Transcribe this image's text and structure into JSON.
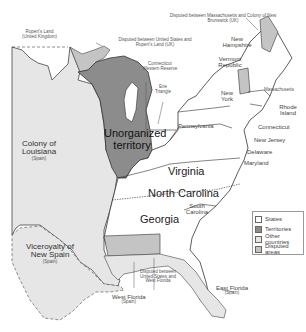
{
  "colors": {
    "states": "#ffffff",
    "territories": "#8c8c8c",
    "other_countries": "#e6e6e6",
    "disputed_areas": "#c4c4c4",
    "water": "#ffffff",
    "border": "#333333"
  },
  "labels": {
    "ruperts_land": {
      "name": "Rupert's Land",
      "sub": "(United Kingdom)"
    },
    "disputed_us_ruperts": "Disputed between United States and Rupert's Land (UK)",
    "disputed_mass_nb": "Disputed between Massachusetts and Colony of New Brunswick (UK)",
    "new_hampshire": "New Hampshire",
    "vermont": "Vermont Republic",
    "massachusetts": "Massachusetts",
    "connecticut_wr": "Connecticut Western Reserve",
    "erie_triangle": "Erie Triangle",
    "new_york": "New York",
    "rhode_island": "Rhode Island",
    "connecticut": "Connecticut",
    "pennsylvania": "Pennsylvania",
    "new_jersey": "New Jersey",
    "delaware": "Delaware",
    "maryland": "Maryland",
    "unorganized": "Unorganized territory",
    "louisiana": {
      "name": "Colony of Louisiana",
      "sub": "(Spain)"
    },
    "virginia": "Virginia",
    "north_carolina": "North Carolina",
    "south_carolina": "South Carolina",
    "georgia": "Georgia",
    "new_spain": {
      "name": "Viceroyalty of New Spain",
      "sub": "(Spain)"
    },
    "disputed_us_wf": "Disputed between United States and West Florida",
    "east_florida": {
      "name": "East Florida",
      "sub": "(Spain)"
    },
    "west_florida": {
      "name": "West Florida",
      "sub": "(Spain)"
    }
  },
  "legend": [
    {
      "label": "States",
      "color": "#ffffff"
    },
    {
      "label": "Territories",
      "color": "#8c8c8c"
    },
    {
      "label": "Other countries",
      "color": "#e6e6e6"
    },
    {
      "label": "Disputed areas",
      "color": "#c4c4c4"
    }
  ]
}
